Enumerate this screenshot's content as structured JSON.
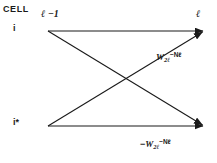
{
  "diagram": {
    "title_label": "CELL",
    "nodes": [
      {
        "id": "top-left",
        "label": "i",
        "x": 48,
        "y": 31
      },
      {
        "id": "top-right",
        "label": "",
        "x": 205,
        "y": 31
      },
      {
        "id": "bottom-left",
        "label": "i*",
        "x": 48,
        "y": 126
      },
      {
        "id": "bottom-right",
        "label": "",
        "x": 205,
        "y": 126
      }
    ],
    "node_labels": {
      "upper": "i",
      "lower": "i*"
    },
    "time_labels": {
      "previous": "ℓ −1",
      "current": "ℓ"
    },
    "edges": [
      {
        "id": "top-straight",
        "from": "top-left",
        "to": "top-right",
        "weight_label": ""
      },
      {
        "id": "bottom-straight",
        "from": "bottom-left",
        "to": "bottom-right",
        "weight_label": ""
      },
      {
        "id": "cross-down",
        "from": "top-left",
        "to": "bottom-right",
        "weight_label": "-W2l-Nl"
      },
      {
        "id": "cross-up",
        "from": "bottom-left",
        "to": "top-right",
        "weight_label": "W2l-Nl"
      }
    ],
    "weights": {
      "positive": {
        "base": "W",
        "subscript": "2ℓ",
        "exponent": "−Nℓ",
        "plain": "W2ℓ^(−Nℓ)"
      },
      "negative": {
        "sign": "−",
        "base": "W",
        "subscript": "2ℓ",
        "exponent": "−Nℓ",
        "plain": "−W2ℓ^(−Nℓ)"
      }
    },
    "colors": {
      "line": "#1a1a1a",
      "text": "#1a1a1a",
      "background": "#ffffff"
    }
  }
}
